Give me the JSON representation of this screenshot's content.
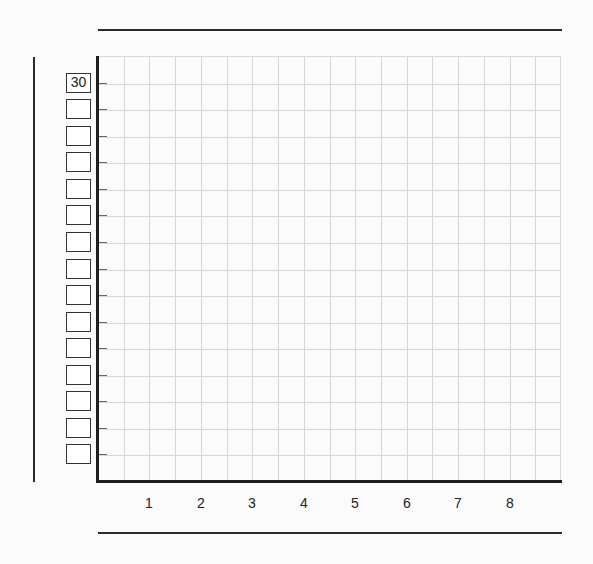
{
  "chart_data": {
    "type": "line",
    "title": "",
    "xlabel": "",
    "ylabel": "",
    "x_tick_labels": [
      "1",
      "2",
      "3",
      "4",
      "5",
      "6",
      "7",
      "8"
    ],
    "y_tick_labels": [
      "30",
      "",
      "",
      "",
      "",
      "",
      "",
      "",
      "",
      "",
      "",
      "",
      "",
      "",
      ""
    ],
    "y_label_boxes_count": 15,
    "grid": true,
    "grid_columns": 18,
    "grid_rows": 16,
    "series": [],
    "note": "Blank graph template with only the top y-axis box filled (30); no data plotted"
  },
  "colors": {
    "axis": "#1e1e1e",
    "grid": "#d6d6d6",
    "background": "#fbfbfb"
  }
}
